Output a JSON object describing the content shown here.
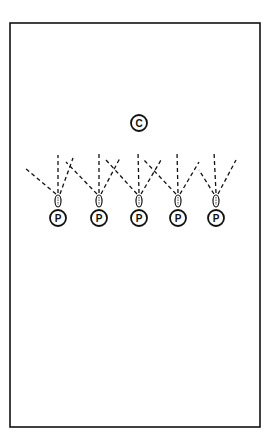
{
  "diagram": {
    "field": {
      "x": 10,
      "y": 23,
      "width": 250,
      "height": 404
    },
    "coach": {
      "label": "C",
      "x": 139,
      "y": 123,
      "r": 8
    },
    "players": [
      {
        "label": "P",
        "x": 58,
        "y": 218,
        "ball_y": 201
      },
      {
        "label": "P",
        "x": 99,
        "y": 218,
        "ball_y": 201
      },
      {
        "label": "P",
        "x": 139,
        "y": 218,
        "ball_y": 201
      },
      {
        "label": "P",
        "x": 178,
        "y": 218,
        "ball_y": 201
      },
      {
        "label": "P",
        "x": 216,
        "y": 218,
        "ball_y": 201
      }
    ],
    "player_radius": 8,
    "colors": {
      "stroke": "#111111",
      "background": "#ffffff"
    }
  }
}
